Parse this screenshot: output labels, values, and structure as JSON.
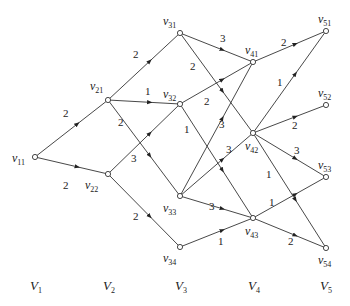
{
  "chart_data": {
    "type": "directed-layered-graph",
    "nodes": [
      {
        "id": "v11",
        "name": "v",
        "sub": "11",
        "x": 35,
        "y": 157,
        "lx": 12,
        "ly": 162
      },
      {
        "id": "v21",
        "name": "v",
        "sub": "21",
        "x": 108,
        "y": 100,
        "lx": 90,
        "ly": 90
      },
      {
        "id": "v22",
        "name": "v",
        "sub": "22",
        "x": 108,
        "y": 174,
        "lx": 85,
        "ly": 189
      },
      {
        "id": "v31",
        "name": "v",
        "sub": "31",
        "x": 180,
        "y": 33,
        "lx": 163,
        "ly": 25
      },
      {
        "id": "v32",
        "name": "v",
        "sub": "32",
        "x": 180,
        "y": 104,
        "lx": 163,
        "ly": 98
      },
      {
        "id": "v33",
        "name": "v",
        "sub": "33",
        "x": 180,
        "y": 196,
        "lx": 163,
        "ly": 212
      },
      {
        "id": "v34",
        "name": "v",
        "sub": "34",
        "x": 180,
        "y": 247,
        "lx": 163,
        "ly": 262
      },
      {
        "id": "v41",
        "name": "v",
        "sub": "41",
        "x": 253,
        "y": 62,
        "lx": 245,
        "ly": 54
      },
      {
        "id": "v42",
        "name": "v",
        "sub": "42",
        "x": 253,
        "y": 133,
        "lx": 245,
        "ly": 150
      },
      {
        "id": "v43",
        "name": "v",
        "sub": "43",
        "x": 253,
        "y": 218,
        "lx": 245,
        "ly": 235
      },
      {
        "id": "v51",
        "name": "v",
        "sub": "51",
        "x": 326,
        "y": 31,
        "lx": 318,
        "ly": 23
      },
      {
        "id": "v52",
        "name": "v",
        "sub": "52",
        "x": 326,
        "y": 105,
        "lx": 318,
        "ly": 97
      },
      {
        "id": "v53",
        "name": "v",
        "sub": "53",
        "x": 326,
        "y": 177,
        "lx": 318,
        "ly": 169
      },
      {
        "id": "v54",
        "name": "v",
        "sub": "54",
        "x": 326,
        "y": 248,
        "lx": 318,
        "ly": 264
      }
    ],
    "edges": [
      {
        "from": "v11",
        "to": "v21",
        "w": "2",
        "wx": 63,
        "wy": 117
      },
      {
        "from": "v11",
        "to": "v22",
        "w": "2",
        "wx": 63,
        "wy": 189
      },
      {
        "from": "v21",
        "to": "v31",
        "w": "2",
        "wx": 133,
        "wy": 58
      },
      {
        "from": "v21",
        "to": "v32",
        "w": "1",
        "wx": 145,
        "wy": 95
      },
      {
        "from": "v21",
        "to": "v33",
        "w": "2",
        "wx": 118,
        "wy": 126
      },
      {
        "from": "v22",
        "to": "v32",
        "w": "3",
        "wx": 131,
        "wy": 162
      },
      {
        "from": "v22",
        "to": "v34",
        "w": "2",
        "wx": 133,
        "wy": 220
      },
      {
        "from": "v31",
        "to": "v41",
        "w": "3",
        "wx": 220,
        "wy": 42
      },
      {
        "from": "v31",
        "to": "v42",
        "w": "2",
        "wx": 190,
        "wy": 70
      },
      {
        "from": "v32",
        "to": "v41",
        "w": "2",
        "wx": 204,
        "wy": 105
      },
      {
        "from": "v32",
        "to": "v43",
        "w": "1",
        "wx": 184,
        "wy": 133
      },
      {
        "from": "v33",
        "to": "v41",
        "w": "3",
        "wx": 219,
        "wy": 128
      },
      {
        "from": "v33",
        "to": "v42",
        "w": "3",
        "wx": 226,
        "wy": 153
      },
      {
        "from": "v33",
        "to": "v43",
        "w": "3",
        "wx": 209,
        "wy": 210
      },
      {
        "from": "v34",
        "to": "v43",
        "w": "1",
        "wx": 218,
        "wy": 245
      },
      {
        "from": "v41",
        "to": "v51",
        "w": "2",
        "wx": 281,
        "wy": 46
      },
      {
        "from": "v42",
        "to": "v51",
        "w": "1",
        "wx": 277,
        "wy": 86
      },
      {
        "from": "v42",
        "to": "v52",
        "w": "2",
        "wx": 292,
        "wy": 129
      },
      {
        "from": "v42",
        "to": "v53",
        "w": "3",
        "wx": 294,
        "wy": 154
      },
      {
        "from": "v42",
        "to": "v54",
        "w": "1",
        "wx": 266,
        "wy": 178
      },
      {
        "from": "v43",
        "to": "v53",
        "w": "1",
        "wx": 269,
        "wy": 206
      },
      {
        "from": "v43",
        "to": "v54",
        "w": "2",
        "wx": 288,
        "wy": 245
      }
    ],
    "layers": [
      {
        "label": "V",
        "sub": "1",
        "x": 30
      },
      {
        "label": "V",
        "sub": "2",
        "x": 103
      },
      {
        "label": "V",
        "sub": "3",
        "x": 175
      },
      {
        "label": "V",
        "sub": "4",
        "x": 248
      },
      {
        "label": "V",
        "sub": "5",
        "x": 320
      }
    ],
    "layer_label_y": 290
  },
  "style": {
    "edge_color": "#333333",
    "node_fill": "#ffffff",
    "text_color": "#222222"
  }
}
